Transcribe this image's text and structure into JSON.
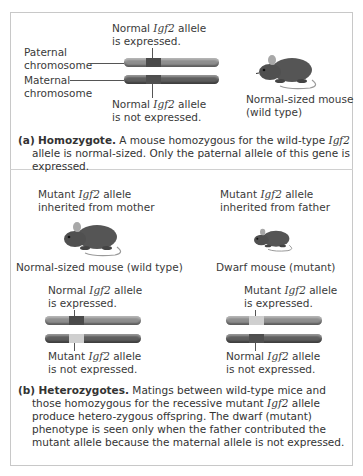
{
  "colors": {
    "paternal_chromosome": "#8e8e8e",
    "maternal_chromosome": "#5e5e5e",
    "normal_band": "#4a4a4a",
    "mutant_band": "#cfcfcf",
    "mouse": "#505050",
    "frame_border": "#c8c8c8"
  },
  "panel_a": {
    "labels": {
      "paternal": [
        "Paternal",
        "chromosome"
      ],
      "maternal": [
        "Maternal",
        "chromosome"
      ],
      "top_allele": {
        "pre": "Normal ",
        "gene": "Igf2",
        "post": " allele",
        "line2": "is expressed."
      },
      "bottom_allele": {
        "pre": "Normal ",
        "gene": "Igf2",
        "post": " allele",
        "line2": "is not expressed."
      },
      "mouse": [
        "Normal-sized mouse",
        "(wild type)"
      ]
    },
    "caption": {
      "letter": "(a)",
      "heading": "Homozygote.",
      "text1": " A mouse homozygous for the wild-type ",
      "gene": "Igf2",
      "text2": " allele is normal-sized. Only the paternal allele of this gene is expressed."
    }
  },
  "panel_b": {
    "left": {
      "title": {
        "pre": "Mutant ",
        "gene": "Igf2",
        "post": " allele",
        "line2": "inherited from mother"
      },
      "mouse_label": "Normal-sized mouse (wild type)",
      "top_allele": {
        "pre": "Normal ",
        "gene": "Igf2",
        "post": " allele",
        "line2": "is expressed."
      },
      "bottom_allele": {
        "pre": "Mutant ",
        "gene": "Igf2",
        "post": " allele",
        "line2": "is not expressed."
      }
    },
    "right": {
      "title": {
        "pre": "Mutant ",
        "gene": "Igf2",
        "post": " allele",
        "line2": "inherited from father"
      },
      "mouse_label": "Dwarf mouse (mutant)",
      "top_allele": {
        "pre": "Mutant ",
        "gene": "Igf2",
        "post": " allele",
        "line2": "is expressed."
      },
      "bottom_allele": {
        "pre": "Normal ",
        "gene": "Igf2",
        "post": " allele",
        "line2": "is not expressed."
      }
    },
    "caption": {
      "letter": "(b)",
      "heading": "Heterozygotes.",
      "text1": " Matings between wild-type mice and those homozygous for the recessive mutant ",
      "gene": "Igf2",
      "text2": " allele produce hetero-zygous offspring. The dwarf (mutant) phenotype is seen only when the father contributed the mutant allele because the maternal allele is not expressed."
    }
  }
}
